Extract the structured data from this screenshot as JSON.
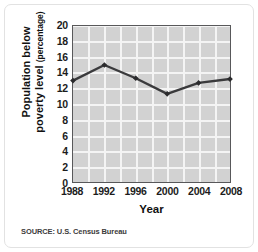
{
  "figure": {
    "source_note": "SOURCE: U.S. Census Bureau"
  },
  "chart_data": {
    "type": "line",
    "title": "",
    "xlabel": "Year",
    "ylabel": "Population below poverty level",
    "ylabel_unit": "(percentage)",
    "categories": [
      "1988",
      "1992",
      "1996",
      "2000",
      "2004",
      "2008"
    ],
    "x": [
      1988,
      1992,
      1996,
      2000,
      2004,
      2008
    ],
    "values": [
      13.0,
      15.0,
      13.3,
      11.3,
      12.7,
      13.2
    ],
    "series": [
      {
        "name": "Population below poverty level",
        "values": [
          13.0,
          15.0,
          13.3,
          11.3,
          12.7,
          13.2
        ]
      }
    ],
    "xlim": [
      1988,
      2008
    ],
    "ylim": [
      0,
      20
    ],
    "ytick_labels": [
      "20",
      "18",
      "16",
      "14",
      "12",
      "10",
      "8",
      "6",
      "4",
      "2",
      "0"
    ],
    "ytick_values": [
      20,
      18,
      16,
      14,
      12,
      10,
      8,
      6,
      4,
      2,
      0
    ],
    "xtick_labels": [
      "1988",
      "1992",
      "1996",
      "2000",
      "2004",
      "2008"
    ],
    "grid": true,
    "legend": "none",
    "colors": {
      "plot_background": "#d2d2d2",
      "gridline": "#f4f4f4",
      "line": "#3a3a3c",
      "marker": "#2b2b2d",
      "axis_border": "#58585a",
      "text": "#111111"
    }
  }
}
